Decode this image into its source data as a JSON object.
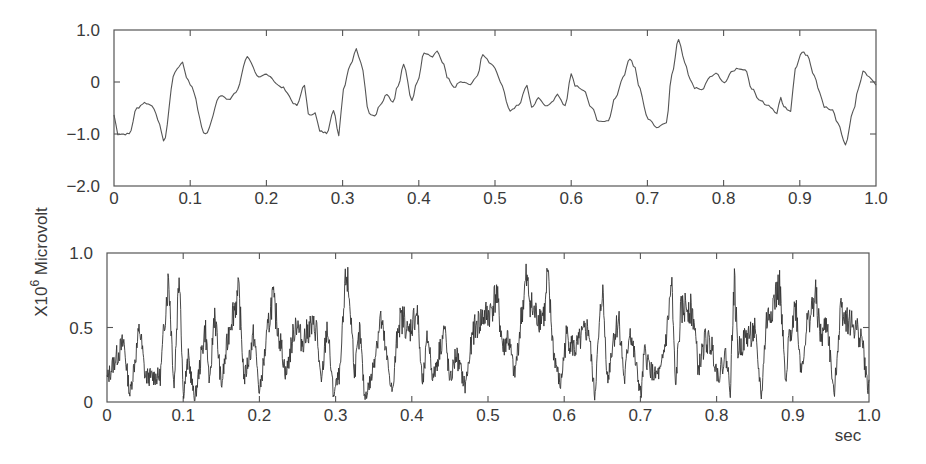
{
  "figure": {
    "ylabel_prefix": "X10",
    "ylabel_exponent": "6",
    "ylabel_unit": " Microvolt",
    "xlabel": "sec"
  },
  "chart_data": [
    {
      "type": "line",
      "title": "",
      "xlabel": "",
      "ylabel": "X10^6 Microvolt",
      "xlim": [
        0,
        1.0
      ],
      "ylim": [
        -2.0,
        1.0
      ],
      "grid": false,
      "legend": null,
      "x_ticks": [
        "0",
        "0.1",
        "0.2",
        "0.3",
        "0.4",
        "0.5",
        "0.6",
        "0.7",
        "0.8",
        "0.9",
        "1.0"
      ],
      "y_ticks": [
        "1.0",
        "0",
        "-1.0",
        "-2.0"
      ],
      "y_tick_values": [
        1.0,
        0,
        -1.0,
        -2.0
      ],
      "series": [
        {
          "name": "signal",
          "x": [
            0,
            0.005,
            0.02,
            0.03,
            0.04,
            0.05,
            0.06,
            0.065,
            0.08,
            0.09,
            0.095,
            0.1,
            0.12,
            0.14,
            0.15,
            0.16,
            0.175,
            0.19,
            0.2,
            0.22,
            0.24,
            0.25,
            0.255,
            0.264,
            0.27,
            0.279,
            0.288,
            0.295,
            0.301,
            0.31,
            0.318,
            0.324,
            0.335,
            0.342,
            0.349,
            0.358,
            0.366,
            0.373,
            0.38,
            0.391,
            0.398,
            0.407,
            0.418,
            0.424,
            0.433,
            0.437,
            0.446,
            0.455,
            0.468,
            0.477,
            0.484,
            0.495,
            0.5,
            0.507,
            0.52,
            0.531,
            0.542,
            0.548,
            0.557,
            0.566,
            0.574,
            0.582,
            0.592,
            0.6,
            0.605,
            0.616,
            0.627,
            0.636,
            0.649,
            0.658,
            0.668,
            0.677,
            0.684,
            0.688,
            0.701,
            0.712,
            0.725,
            0.732,
            0.741,
            0.749,
            0.756,
            0.762,
            0.771,
            0.782,
            0.79,
            0.801,
            0.81,
            0.819,
            0.828,
            0.837,
            0.846,
            0.859,
            0.87,
            0.875,
            0.879,
            0.888,
            0.894,
            0.903,
            0.91,
            0.919,
            0.926,
            0.932,
            0.943,
            0.95,
            0.96,
            0.97,
            0.977,
            0.983,
            0.994,
            1.0
          ],
          "values": [
            -0.63,
            -1.0,
            -1.0,
            -0.5,
            -0.4,
            -0.45,
            -0.8,
            -1.15,
            0.2,
            0.38,
            0.1,
            -0.05,
            -1.0,
            -0.25,
            -0.35,
            -0.2,
            0.48,
            0.08,
            0.15,
            -0.1,
            -0.45,
            -0.05,
            -0.63,
            -0.6,
            -0.95,
            -0.98,
            -0.55,
            -1.02,
            -0.12,
            0.33,
            0.63,
            0.38,
            -0.6,
            -0.65,
            -0.45,
            -0.25,
            -0.38,
            -0.06,
            0.35,
            -0.35,
            0.0,
            0.55,
            0.48,
            0.58,
            0.33,
            0.08,
            -0.1,
            0.0,
            -0.05,
            0.13,
            0.52,
            0.36,
            0.27,
            0.0,
            -0.55,
            -0.45,
            -0.06,
            -0.5,
            -0.3,
            -0.45,
            -0.4,
            -0.25,
            -0.45,
            0.15,
            -0.06,
            -0.15,
            -0.5,
            -0.77,
            -0.73,
            -0.3,
            0.08,
            0.45,
            0.27,
            -0.06,
            -0.7,
            -0.88,
            -0.77,
            0.13,
            0.82,
            0.38,
            0.07,
            -0.12,
            -0.15,
            0.1,
            0.17,
            -0.02,
            0.2,
            0.27,
            0.23,
            -0.12,
            -0.35,
            -0.45,
            -0.6,
            -0.3,
            -0.48,
            -0.55,
            0.27,
            0.57,
            0.52,
            0.13,
            -0.18,
            -0.48,
            -0.55,
            -0.8,
            -1.2,
            -0.57,
            -0.12,
            0.2,
            0.07,
            -0.06
          ]
        }
      ]
    },
    {
      "type": "line",
      "title": "",
      "xlabel": "sec",
      "ylabel": "X10^6 Microvolt",
      "xlim": [
        0,
        1.0
      ],
      "ylim": [
        0,
        1.0
      ],
      "grid": false,
      "legend": null,
      "x_ticks": [
        "0",
        "0.1",
        "0.2",
        "0.3",
        "0.4",
        "0.5",
        "0.6",
        "0.7",
        "0.8",
        "0.9",
        "1.0"
      ],
      "y_ticks": [
        "1.0",
        "0.5",
        "0"
      ],
      "y_tick_values": [
        1.0,
        0.5,
        0
      ],
      "series": [
        {
          "name": "envelope / amplitude",
          "x": [
            0,
            0.01,
            0.022,
            0.03,
            0.043,
            0.05,
            0.06,
            0.07,
            0.077,
            0.081,
            0.088,
            0.095,
            0.1,
            0.107,
            0.115,
            0.129,
            0.135,
            0.141,
            0.15,
            0.162,
            0.173,
            0.18,
            0.193,
            0.2,
            0.217,
            0.226,
            0.235,
            0.248,
            0.256,
            0.266,
            0.275,
            0.281,
            0.289,
            0.297,
            0.306,
            0.314,
            0.319,
            0.325,
            0.332,
            0.338,
            0.347,
            0.359,
            0.367,
            0.375,
            0.382,
            0.39,
            0.395,
            0.407,
            0.414,
            0.421,
            0.428,
            0.443,
            0.45,
            0.458,
            0.47,
            0.481,
            0.493,
            0.503,
            0.511,
            0.52,
            0.526,
            0.535,
            0.544,
            0.55,
            0.559,
            0.567,
            0.575,
            0.578,
            0.586,
            0.595,
            0.603,
            0.614,
            0.625,
            0.632,
            0.64,
            0.65,
            0.657,
            0.664,
            0.672,
            0.679,
            0.686,
            0.701,
            0.705,
            0.718,
            0.727,
            0.735,
            0.741,
            0.746,
            0.753,
            0.762,
            0.77,
            0.776,
            0.785,
            0.794,
            0.802,
            0.812,
            0.818,
            0.823,
            0.828,
            0.841,
            0.85,
            0.859,
            0.865,
            0.879,
            0.883,
            0.891,
            0.895,
            0.904,
            0.911,
            0.918,
            0.93,
            0.937,
            0.945,
            0.954,
            0.963,
            0.967,
            0.973,
            0.982,
            0.991,
            0.998,
            1.0
          ],
          "values": [
            0.15,
            0.28,
            0.4,
            0.05,
            0.5,
            0.17,
            0.17,
            0.17,
            0.64,
            0.84,
            0.1,
            0.93,
            0.05,
            0.3,
            0.0,
            0.5,
            0.1,
            0.63,
            0.1,
            0.55,
            0.73,
            0.15,
            0.46,
            0.05,
            0.71,
            0.45,
            0.18,
            0.55,
            0.4,
            0.5,
            0.5,
            0.1,
            0.52,
            0.05,
            0.2,
            0.88,
            0.65,
            0.2,
            0.47,
            0.03,
            0.16,
            0.57,
            0.3,
            0.05,
            0.53,
            0.56,
            0.45,
            0.62,
            0.1,
            0.45,
            0.15,
            0.5,
            0.12,
            0.33,
            0.1,
            0.48,
            0.57,
            0.6,
            0.73,
            0.35,
            0.45,
            0.17,
            0.58,
            0.82,
            0.6,
            0.57,
            0.6,
            0.85,
            0.34,
            0.1,
            0.45,
            0.35,
            0.45,
            0.5,
            0.03,
            0.78,
            0.13,
            0.42,
            0.56,
            0.13,
            0.5,
            0.03,
            0.33,
            0.17,
            0.2,
            0.48,
            0.8,
            0.1,
            0.6,
            0.66,
            0.57,
            0.21,
            0.42,
            0.37,
            0.17,
            0.32,
            0.08,
            0.82,
            0.35,
            0.45,
            0.47,
            0.03,
            0.53,
            0.73,
            0.77,
            0.08,
            0.44,
            0.65,
            0.2,
            0.5,
            0.71,
            0.42,
            0.54,
            0.03,
            0.65,
            0.6,
            0.54,
            0.5,
            0.42,
            0.1,
            0.12
          ],
          "note": "High-frequency rectified signal; values are approximate peaks/troughs read from the plot"
        }
      ]
    }
  ]
}
